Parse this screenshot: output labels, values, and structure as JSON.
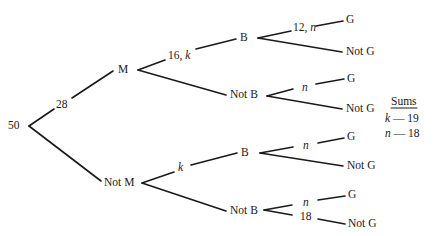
{
  "diagram": {
    "type": "probability_tree",
    "root": {
      "label": "50"
    },
    "level1": [
      {
        "node": "M",
        "edge_label": "28"
      },
      {
        "node": "Not M",
        "edge_label": ""
      }
    ],
    "level2": {
      "M": [
        {
          "node": "B",
          "edge_label": "16, k"
        },
        {
          "node": "Not B",
          "edge_label": ""
        }
      ],
      "Not M": [
        {
          "node": "B",
          "edge_label": "k"
        },
        {
          "node": "Not B",
          "edge_label": ""
        }
      ]
    },
    "level3": {
      "M.B": [
        {
          "node": "G",
          "edge_label": "12, n"
        },
        {
          "node": "Not G",
          "edge_label": ""
        }
      ],
      "M.NotB": [
        {
          "node": "G",
          "edge_label": "n"
        },
        {
          "node": "Not G",
          "edge_label": ""
        }
      ],
      "NotM.B": [
        {
          "node": "G",
          "edge_label": "n"
        },
        {
          "node": "Not G",
          "edge_label": ""
        }
      ],
      "NotM.NotB": [
        {
          "node": "G",
          "edge_label": "n"
        },
        {
          "node": "Not G",
          "edge_label": "18"
        }
      ]
    },
    "labels": {
      "root": "50",
      "e28": "28",
      "M": "M",
      "NotM": "Not M",
      "e16k": "16,",
      "e16k_var": "k",
      "eNotM_k": "k",
      "B1": "B",
      "NotB1": "Not B",
      "B2": "B",
      "NotB2": "Not B",
      "e12n": "12,",
      "e12n_var": "n",
      "G1": "G",
      "NotG1": "Not G",
      "en2": "n",
      "G2": "G",
      "NotG2": "Not G",
      "en3": "n",
      "G3": "G",
      "NotG3": "Not G",
      "en4": "n",
      "G4": "G",
      "e18": "18",
      "NotG4": "Not G"
    },
    "sums": {
      "title": "Sums",
      "rows": [
        {
          "var": "k",
          "dash": "—",
          "value": "19"
        },
        {
          "var": "n",
          "dash": "—",
          "value": "18"
        }
      ]
    }
  }
}
